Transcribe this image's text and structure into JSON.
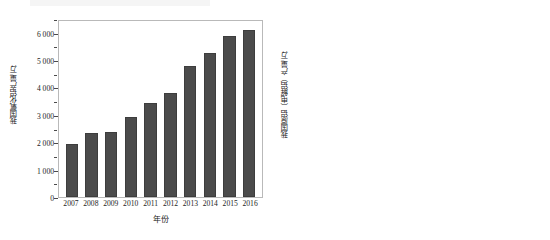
{
  "figure": {
    "background": "#ffffff",
    "bar_color": "#4b4b4b",
    "frame_color": "#b9b9b9"
  },
  "charts": [
    {
      "panel": "left",
      "chart_data": {
        "type": "bar",
        "title": "",
        "xlabel": "年份",
        "ylabel": "我国氧化铝产量/万t",
        "categories": [
          "2007",
          "2008",
          "2009",
          "2010",
          "2011",
          "2012",
          "2013",
          "2014",
          "2015",
          "2016"
        ],
        "values": [
          1950,
          2320,
          2390,
          2910,
          3450,
          3790,
          4780,
          5250,
          5890,
          6110
        ],
        "ylim": [
          0,
          6500
        ],
        "ytick_labels": [
          "0",
          "1 000",
          "2 000",
          "3 000",
          "4 000",
          "5 000",
          "6 000"
        ],
        "ytick_values": [
          0,
          1000,
          2000,
          3000,
          4000,
          5000,
          6000
        ],
        "yminor_values": [
          500,
          1500,
          2500,
          3500,
          4500,
          5500,
          6500
        ],
        "grid": false,
        "legend": "none"
      }
    },
    {
      "panel": "right",
      "chart_data": {
        "type": "bar",
        "title": "",
        "xlabel": "年份",
        "ylabel": "我国原铝（电解铝）产量/万t",
        "categories": [
          "2007",
          "2008",
          "2009",
          "2010",
          "2011",
          "2012",
          "2013",
          "2014",
          "2015",
          "2016"
        ],
        "values": [
          1240,
          1330,
          1290,
          1580,
          1970,
          2320,
          2540,
          2890,
          3140,
          3270
        ],
        "ylim": [
          0,
          3500
        ],
        "ytick_labels": [
          "0",
          "500",
          "1 000",
          "1 500",
          "2 000",
          "2 500",
          "3 000",
          "3 500"
        ],
        "ytick_values": [
          0,
          500,
          1000,
          1500,
          2000,
          2500,
          3000,
          3500
        ],
        "yminor_values": [
          250,
          750,
          1250,
          1750,
          2250,
          2750,
          3250
        ],
        "grid": false,
        "legend": "none"
      }
    }
  ]
}
